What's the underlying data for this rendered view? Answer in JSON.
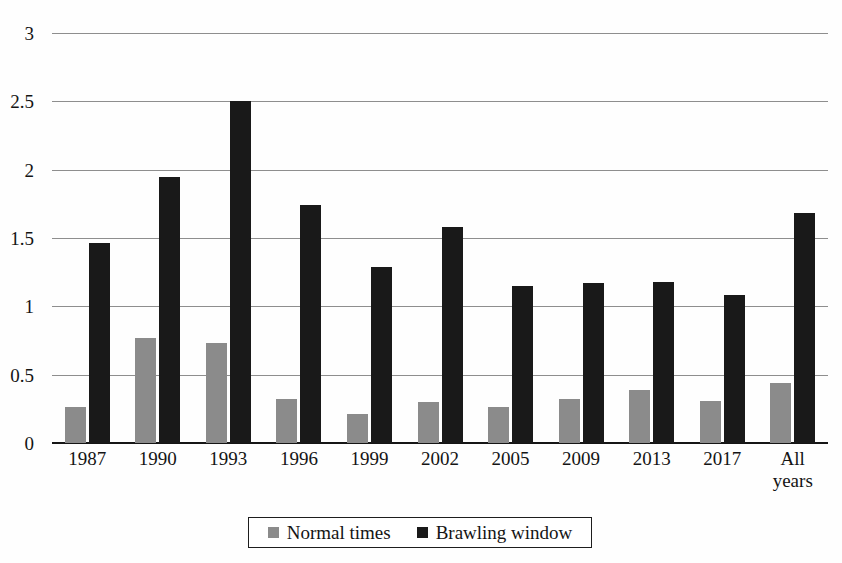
{
  "chart_data": {
    "type": "bar",
    "title": "",
    "subtitle": "",
    "xlabel": "",
    "ylabel": "",
    "ylim": [
      0,
      3
    ],
    "yticks": [
      "0",
      "0.5",
      "1",
      "1.5",
      "2",
      "2.5",
      "3"
    ],
    "ytick_values": [
      0,
      0.5,
      1,
      1.5,
      2,
      2.5,
      3
    ],
    "grid": true,
    "legend_position": "bottom",
    "categories": [
      "1987",
      "1990",
      "1993",
      "1996",
      "1999",
      "2002",
      "2005",
      "2009",
      "2013",
      "2017",
      "All\nyears"
    ],
    "series": [
      {
        "name": "Normal times",
        "color": "#8b8b8b",
        "values": [
          0.26,
          0.77,
          0.73,
          0.32,
          0.21,
          0.3,
          0.26,
          0.32,
          0.39,
          0.31,
          0.44
        ]
      },
      {
        "name": "Brawling window",
        "color": "#191919",
        "values": [
          1.46,
          1.95,
          2.5,
          1.74,
          1.29,
          1.58,
          1.15,
          1.17,
          1.18,
          1.08,
          1.68
        ]
      }
    ]
  },
  "legend": {
    "entries": [
      {
        "label": "Normal times",
        "swatch": "gray-swatch-icon"
      },
      {
        "label": "Brawling window",
        "swatch": "black-swatch-icon"
      }
    ]
  },
  "colors": {
    "normal_times": "#8b8b8b",
    "brawling_window": "#191919",
    "gridline": "#8e8e8e",
    "axis": "#151515",
    "background": "#fefefe"
  }
}
